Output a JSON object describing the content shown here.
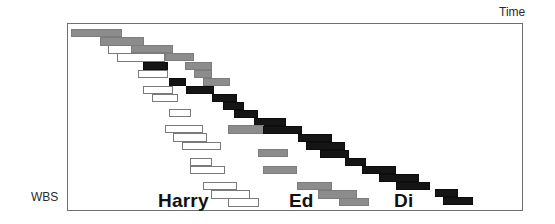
{
  "labels": {
    "x_axis": "Time",
    "y_axis": "WBS",
    "owners": [
      {
        "name": "Harry",
        "x": 158,
        "y": 190
      },
      {
        "name": "Ed",
        "x": 289,
        "y": 190
      },
      {
        "name": "Di",
        "x": 394,
        "y": 190
      }
    ]
  },
  "colors": {
    "Harry": "#ffffff",
    "Ed": "#8c8c8c",
    "Di": "#151515",
    "frame": "#6e6e6e"
  },
  "chart_data": {
    "type": "gantt",
    "title": "",
    "xlabel": "Time",
    "ylabel": "WBS",
    "legend": [
      "Harry (white)",
      "Ed (grey)",
      "Di (black)"
    ],
    "grid": false,
    "bars": [
      {
        "owner": "Ed",
        "x": 71,
        "y": 29,
        "w": 51,
        "h": 8
      },
      {
        "owner": "Ed",
        "x": 100,
        "y": 37,
        "w": 44,
        "h": 9
      },
      {
        "owner": "Harry",
        "x": 108,
        "y": 45,
        "w": 26,
        "h": 9
      },
      {
        "owner": "Ed",
        "x": 131,
        "y": 45,
        "w": 42,
        "h": 8
      },
      {
        "owner": "Harry",
        "x": 117,
        "y": 53,
        "w": 48,
        "h": 9
      },
      {
        "owner": "Ed",
        "x": 165,
        "y": 53,
        "w": 29,
        "h": 8
      },
      {
        "owner": "Di",
        "x": 143,
        "y": 62,
        "w": 25,
        "h": 8
      },
      {
        "owner": "Ed",
        "x": 185,
        "y": 62,
        "w": 27,
        "h": 8
      },
      {
        "owner": "Harry",
        "x": 138,
        "y": 70,
        "w": 30,
        "h": 8
      },
      {
        "owner": "Ed",
        "x": 194,
        "y": 70,
        "w": 18,
        "h": 8
      },
      {
        "owner": "Di",
        "x": 169,
        "y": 78,
        "w": 17,
        "h": 8
      },
      {
        "owner": "Ed",
        "x": 203,
        "y": 78,
        "w": 27,
        "h": 8
      },
      {
        "owner": "Harry",
        "x": 143,
        "y": 86,
        "w": 30,
        "h": 8
      },
      {
        "owner": "Di",
        "x": 186,
        "y": 86,
        "w": 28,
        "h": 8
      },
      {
        "owner": "Harry",
        "x": 152,
        "y": 94,
        "w": 26,
        "h": 8
      },
      {
        "owner": "Di",
        "x": 212,
        "y": 94,
        "w": 25,
        "h": 8
      },
      {
        "owner": "Di",
        "x": 223,
        "y": 102,
        "w": 21,
        "h": 8
      },
      {
        "owner": "Harry",
        "x": 169,
        "y": 109,
        "w": 22,
        "h": 8
      },
      {
        "owner": "Di",
        "x": 234,
        "y": 110,
        "w": 24,
        "h": 8
      },
      {
        "owner": "Di",
        "x": 254,
        "y": 118,
        "w": 32,
        "h": 8
      },
      {
        "owner": "Harry",
        "x": 165,
        "y": 125,
        "w": 38,
        "h": 8
      },
      {
        "owner": "Ed",
        "x": 228,
        "y": 125,
        "w": 36,
        "h": 9
      },
      {
        "owner": "Di",
        "x": 263,
        "y": 126,
        "w": 39,
        "h": 8
      },
      {
        "owner": "Harry",
        "x": 173,
        "y": 133,
        "w": 34,
        "h": 9
      },
      {
        "owner": "Di",
        "x": 298,
        "y": 134,
        "w": 34,
        "h": 8
      },
      {
        "owner": "Harry",
        "x": 182,
        "y": 142,
        "w": 39,
        "h": 8
      },
      {
        "owner": "Di",
        "x": 306,
        "y": 142,
        "w": 39,
        "h": 8
      },
      {
        "owner": "Ed",
        "x": 258,
        "y": 149,
        "w": 30,
        "h": 8
      },
      {
        "owner": "Di",
        "x": 320,
        "y": 150,
        "w": 29,
        "h": 8
      },
      {
        "owner": "Harry",
        "x": 190,
        "y": 158,
        "w": 22,
        "h": 8
      },
      {
        "owner": "Di",
        "x": 345,
        "y": 158,
        "w": 21,
        "h": 8
      },
      {
        "owner": "Harry",
        "x": 190,
        "y": 166,
        "w": 35,
        "h": 8
      },
      {
        "owner": "Ed",
        "x": 263,
        "y": 166,
        "w": 34,
        "h": 8
      },
      {
        "owner": "Di",
        "x": 362,
        "y": 166,
        "w": 34,
        "h": 8
      },
      {
        "owner": "Di",
        "x": 379,
        "y": 174,
        "w": 40,
        "h": 8
      },
      {
        "owner": "Harry",
        "x": 203,
        "y": 182,
        "w": 34,
        "h": 8
      },
      {
        "owner": "Ed",
        "x": 297,
        "y": 182,
        "w": 35,
        "h": 8
      },
      {
        "owner": "Di",
        "x": 396,
        "y": 182,
        "w": 34,
        "h": 8
      },
      {
        "owner": "Di",
        "x": 435,
        "y": 189,
        "w": 23,
        "h": 8
      },
      {
        "owner": "Harry",
        "x": 211,
        "y": 190,
        "w": 39,
        "h": 9
      },
      {
        "owner": "Ed",
        "x": 318,
        "y": 190,
        "w": 39,
        "h": 9
      },
      {
        "owner": "Di",
        "x": 443,
        "y": 197,
        "w": 30,
        "h": 8
      },
      {
        "owner": "Harry",
        "x": 228,
        "y": 198,
        "w": 31,
        "h": 9
      },
      {
        "owner": "Ed",
        "x": 339,
        "y": 198,
        "w": 30,
        "h": 8
      }
    ]
  }
}
